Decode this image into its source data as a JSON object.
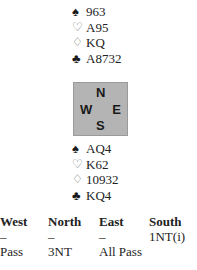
{
  "north": {
    "spades": "963",
    "hearts": "A95",
    "diamonds": "KQ",
    "clubs": "A8732"
  },
  "south": {
    "spades": "AQ4",
    "hearts": "K62",
    "diamonds": "10932",
    "clubs": "KQ4"
  },
  "compass": {
    "n": "N",
    "s": "S",
    "w": "W",
    "e": "E"
  },
  "suits": {
    "spade": "♠",
    "heart": "♡",
    "diamond": "♢",
    "club": "♣"
  },
  "auction": {
    "headers": [
      "West",
      "North",
      "East",
      "South"
    ],
    "rows": [
      [
        "–",
        "–",
        "–",
        "1NT(i)"
      ],
      [
        "Pass",
        "3NT",
        "All Pass",
        ""
      ]
    ]
  }
}
